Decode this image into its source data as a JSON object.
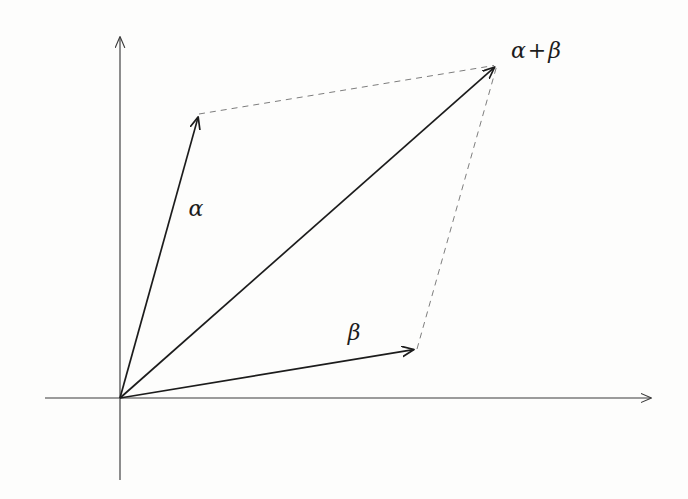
{
  "figure": {
    "background_color": "#fdfdfc",
    "ink_color": "#1c1c1c",
    "axis_color": "#3a3a3a",
    "dash_color": "#6e6e6e"
  },
  "labels": {
    "alpha": "α",
    "beta": "β",
    "sum_left": "α",
    "sum_op": "+",
    "sum_right": "β"
  },
  "chart_data": {
    "type": "diagram",
    "xlabel": "",
    "ylabel": "",
    "grid": false,
    "legend": "none",
    "origin": [
      120,
      398
    ],
    "axes": [
      {
        "name": "x-axis",
        "from": [
          45,
          398
        ],
        "to": [
          655,
          398
        ],
        "arrow": "end",
        "color": "#3a3a3a"
      },
      {
        "name": "y-axis",
        "from": [
          120,
          480
        ],
        "to": [
          120,
          33
        ],
        "arrow": "end",
        "color": "#3a3a3a"
      }
    ],
    "vectors": [
      {
        "name": "alpha",
        "label": "α",
        "from": [
          120,
          398
        ],
        "to": [
          199,
          114
        ],
        "style": "solid",
        "arrow": true,
        "label_pos": [
          196,
          209
        ]
      },
      {
        "name": "beta",
        "label": "β",
        "from": [
          120,
          398
        ],
        "to": [
          417,
          349
        ],
        "style": "solid",
        "arrow": true,
        "label_pos": [
          354,
          333
        ]
      },
      {
        "name": "alpha-plus-beta",
        "label": "α + β",
        "from": [
          120,
          398
        ],
        "to": [
          497,
          65
        ],
        "style": "solid",
        "arrow": true,
        "label_pos": [
          536,
          51
        ]
      }
    ],
    "construction_lines": [
      {
        "name": "alpha-to-sum",
        "from": [
          199,
          114
        ],
        "to": [
          497,
          65
        ],
        "style": "dashed",
        "arrow": false
      },
      {
        "name": "beta-to-sum",
        "from": [
          417,
          349
        ],
        "to": [
          497,
          65
        ],
        "style": "dashed",
        "arrow": false
      }
    ]
  }
}
